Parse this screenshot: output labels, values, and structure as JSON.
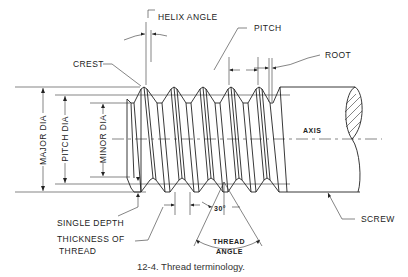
{
  "figure": {
    "caption": "12-4.  Thread terminology.",
    "labels": {
      "helix_angle": "HELIX ANGLE",
      "pitch": "PITCH",
      "root": "ROOT",
      "crest": "CREST",
      "major_dia": "MAJOR DIA",
      "pitch_dia": "PITCH DIA",
      "minor_dia": "MINOR DIA",
      "axis": "AXIS",
      "single_depth": "SINGLE DEPTH",
      "thickness_of_thread_1": "THICKNESS OF",
      "thickness_of_thread_2": "THREAD",
      "thirty_deg": "30°",
      "thread_angle_1": "THREAD",
      "thread_angle_2": "ANGLE",
      "screw": "SCREW"
    },
    "colors": {
      "line": "#222222",
      "background": "#ffffff"
    }
  }
}
